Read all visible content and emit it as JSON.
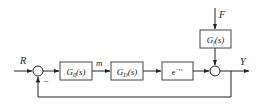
{
  "diagram": {
    "type": "block-diagram",
    "signals": {
      "input": "R",
      "manipulated": "m",
      "disturbance": "F",
      "output": "Y"
    },
    "blocks": [
      {
        "id": "controller",
        "main": "G",
        "sub": "0",
        "arg": "(s)"
      },
      {
        "id": "process",
        "main": "G",
        "sub": "D",
        "arg": "(s)"
      },
      {
        "id": "delay",
        "main": "e",
        "sup": "−τs"
      },
      {
        "id": "disturbance",
        "main": "G",
        "sub": "f",
        "arg": "(s)"
      }
    ],
    "summing_junctions": [
      {
        "id": "error-junction",
        "signs": [
          "+",
          "−"
        ],
        "minus_label": "−"
      },
      {
        "id": "output-junction",
        "signs": [
          "+",
          "+"
        ]
      }
    ],
    "feedback": "unity negative feedback from Y to first summing junction"
  }
}
